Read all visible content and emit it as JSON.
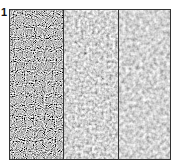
{
  "figure": {
    "panel_label": "1",
    "panels": [
      {
        "name": "high-frequency-noise",
        "texture": "fine black/white speckle",
        "mean_color": "#8a8a8a"
      },
      {
        "name": "mid-frequency-noise",
        "texture": "blotchy gray",
        "mean_color": "#a0a0a0"
      },
      {
        "name": "low-contrast-noise",
        "texture": "smooth light gray",
        "mean_color": "#b0b0b0"
      }
    ],
    "border_color": "#333333"
  }
}
